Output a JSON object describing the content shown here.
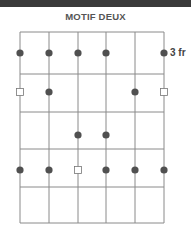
{
  "title": "MOTIF DEUX",
  "fret_label": "3 fr",
  "grid": {
    "strings_x": [
      20,
      49,
      78,
      106,
      135,
      164
    ],
    "frets_y": [
      32,
      74,
      112,
      149,
      187,
      223
    ],
    "line_color": "#8a8a8a"
  },
  "markers": [
    {
      "string": 0,
      "y": 53,
      "type": "dot"
    },
    {
      "string": 1,
      "y": 53,
      "type": "dot"
    },
    {
      "string": 2,
      "y": 53,
      "type": "dot"
    },
    {
      "string": 3,
      "y": 53,
      "type": "dot"
    },
    {
      "string": 5,
      "y": 53,
      "type": "dot"
    },
    {
      "string": 0,
      "y": 92,
      "type": "square"
    },
    {
      "string": 1,
      "y": 92,
      "type": "dot"
    },
    {
      "string": 4,
      "y": 92,
      "type": "dot"
    },
    {
      "string": 5,
      "y": 92,
      "type": "square"
    },
    {
      "string": 2,
      "y": 135,
      "type": "dot"
    },
    {
      "string": 3,
      "y": 135,
      "type": "dot"
    },
    {
      "string": 0,
      "y": 170,
      "type": "dot"
    },
    {
      "string": 1,
      "y": 170,
      "type": "dot"
    },
    {
      "string": 2,
      "y": 170,
      "type": "square"
    },
    {
      "string": 3,
      "y": 170,
      "type": "dot"
    },
    {
      "string": 4,
      "y": 170,
      "type": "dot"
    },
    {
      "string": 5,
      "y": 170,
      "type": "dot"
    }
  ],
  "colors": {
    "dot": "#505050",
    "square_stroke": "#777777"
  }
}
